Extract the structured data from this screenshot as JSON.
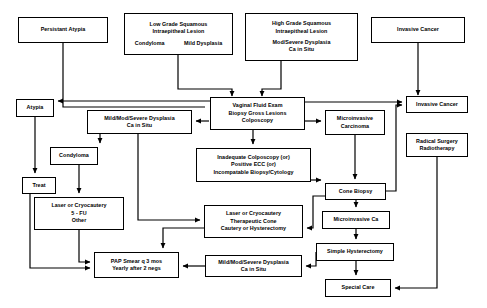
{
  "diagram": {
    "stroke_color": "#000000",
    "background_color": "#ffffff",
    "nodes": [
      {
        "id": "persistant-atypia",
        "lines": [
          "Persistant Atypia"
        ],
        "x": 18,
        "y": 17,
        "w": 90,
        "h": 26
      },
      {
        "id": "low-grade-sil",
        "lines": [
          "Low Grade Squamous",
          "Intraepitheal Lesion"
        ],
        "sub_lines": [
          "Condyloma",
          "Mild Dysplasia"
        ],
        "x": 124,
        "y": 13,
        "w": 109,
        "h": 42
      },
      {
        "id": "high-grade-sil",
        "lines": [
          "High Grade Squamous",
          "Intraepitheal Lesion"
        ],
        "sub_stack": [
          "Mod/Severe Dysplasia",
          "Ca in Situ"
        ],
        "x": 245,
        "y": 13,
        "w": 113,
        "h": 48
      },
      {
        "id": "invasive-cancer-top",
        "lines": [
          "Invasive Cancer"
        ],
        "x": 371,
        "y": 17,
        "w": 94,
        "h": 26
      },
      {
        "id": "vaginal-fluid-exam",
        "lines": [
          "Vaginal Fluid Exam",
          "Biopsy Gross Lesions",
          "Colposcopy"
        ],
        "x": 210,
        "y": 97,
        "w": 95,
        "h": 33
      },
      {
        "id": "atypia",
        "lines": [
          "Atypia"
        ],
        "x": 16,
        "y": 99,
        "w": 38,
        "h": 18
      },
      {
        "id": "mild-mod-severe-dysplasia-top",
        "lines": [
          "Mild/Mod/Severe Dysplasia",
          "Ca in Situ"
        ],
        "x": 87,
        "y": 110,
        "w": 105,
        "h": 24
      },
      {
        "id": "microinvasive-carcinoma",
        "lines": [
          "Microinvasive",
          "Carcinoma"
        ],
        "x": 325,
        "y": 110,
        "w": 60,
        "h": 25
      },
      {
        "id": "invasive-cancer-right",
        "lines": [
          "Invasive Cancer"
        ],
        "x": 406,
        "y": 96,
        "w": 62,
        "h": 17
      },
      {
        "id": "radical-surgery",
        "lines": [
          "Radical Surgery",
          "Radiotherapy"
        ],
        "x": 406,
        "y": 133,
        "w": 62,
        "h": 24
      },
      {
        "id": "condyloma",
        "lines": [
          "Condyloma"
        ],
        "x": 50,
        "y": 147,
        "w": 48,
        "h": 18
      },
      {
        "id": "inadequate-colposcopy",
        "lines": [
          "Inadequate Colposcopy (or)",
          "Positive ECC (or)",
          "Incompatable Biopsy/Cytology"
        ],
        "x": 196,
        "y": 148,
        "w": 115,
        "h": 34
      },
      {
        "id": "treat",
        "lines": [
          "Treat"
        ],
        "x": 22,
        "y": 177,
        "w": 34,
        "h": 17
      },
      {
        "id": "cone-biopsy",
        "lines": [
          "Cone Biopsy"
        ],
        "x": 325,
        "y": 183,
        "w": 61,
        "h": 17
      },
      {
        "id": "laser-cryocautery-5fu",
        "lines": [
          "Laser or Cryocautery",
          "5 - FU",
          "Other"
        ],
        "x": 34,
        "y": 197,
        "w": 90,
        "h": 33
      },
      {
        "id": "laser-cryocautery-therapeutic",
        "lines": [
          "Laser or Cryocautery",
          "Therapeutic Cone",
          "Cautery or Hysterectomy"
        ],
        "x": 204,
        "y": 205,
        "w": 99,
        "h": 33
      },
      {
        "id": "microinvasive-ca",
        "lines": [
          "Microinvasive Ca"
        ],
        "x": 322,
        "y": 211,
        "w": 68,
        "h": 18
      },
      {
        "id": "simple-hysterectomy",
        "lines": [
          "Simple Hysterectomy"
        ],
        "x": 316,
        "y": 243,
        "w": 78,
        "h": 18
      },
      {
        "id": "pap-smear",
        "lines": [
          "PAP Smear q 3 mos",
          "Yearly after 2 negs"
        ],
        "x": 94,
        "y": 252,
        "w": 85,
        "h": 26
      },
      {
        "id": "mild-mod-severe-dysplasia-bottom",
        "lines": [
          "Mild/Mod/Severe Dysplasia",
          "Ca in Situ"
        ],
        "x": 205,
        "y": 255,
        "w": 97,
        "h": 22
      },
      {
        "id": "special-care",
        "lines": [
          "Special Care"
        ],
        "x": 325,
        "y": 279,
        "w": 66,
        "h": 18
      }
    ],
    "edges": [
      {
        "from": "persistant-atypia",
        "to": "vaginal-fluid-exam",
        "label": ""
      },
      {
        "from": "low-grade-sil",
        "to": "vaginal-fluid-exam",
        "label": ""
      },
      {
        "from": "high-grade-sil",
        "to": "vaginal-fluid-exam",
        "label": ""
      },
      {
        "from": "invasive-cancer-top",
        "to": "invasive-cancer-right",
        "label": ""
      },
      {
        "from": "vaginal-fluid-exam",
        "to": "atypia",
        "label": ""
      },
      {
        "from": "vaginal-fluid-exam",
        "to": "mild-mod-severe-dysplasia-top",
        "label": ""
      },
      {
        "from": "vaginal-fluid-exam",
        "to": "microinvasive-carcinoma",
        "label": ""
      },
      {
        "from": "vaginal-fluid-exam",
        "to": "invasive-cancer-right",
        "label": ""
      },
      {
        "from": "vaginal-fluid-exam",
        "to": "inadequate-colposcopy",
        "label": ""
      },
      {
        "from": "atypia",
        "to": "treat",
        "label": ""
      },
      {
        "from": "treat",
        "to": "pap-smear",
        "label": ""
      },
      {
        "from": "mild-mod-severe-dysplasia-top",
        "to": "condyloma",
        "label": ""
      },
      {
        "from": "mild-mod-severe-dysplasia-top",
        "to": "laser-cryocautery-therapeutic",
        "label": ""
      },
      {
        "from": "condyloma",
        "to": "laser-cryocautery-5fu",
        "label": ""
      },
      {
        "from": "laser-cryocautery-5fu",
        "to": "pap-smear",
        "label": ""
      },
      {
        "from": "inadequate-colposcopy",
        "to": "cone-biopsy",
        "label": ""
      },
      {
        "from": "microinvasive-carcinoma",
        "to": "cone-biopsy",
        "label": ""
      },
      {
        "from": "cone-biopsy",
        "to": "microinvasive-ca",
        "label": ""
      },
      {
        "from": "cone-biopsy",
        "to": "invasive-cancer-right",
        "label": ""
      },
      {
        "from": "cone-biopsy",
        "to": "laser-cryocautery-therapeutic",
        "label": ""
      },
      {
        "from": "cone-biopsy",
        "to": "mild-mod-severe-dysplasia-bottom",
        "label": ""
      },
      {
        "from": "laser-cryocautery-therapeutic",
        "to": "pap-smear",
        "label": ""
      },
      {
        "from": "microinvasive-ca",
        "to": "simple-hysterectomy",
        "label": ""
      },
      {
        "from": "simple-hysterectomy",
        "to": "special-care",
        "label": ""
      },
      {
        "from": "radical-surgery",
        "to": "special-care",
        "label": ""
      },
      {
        "from": "mild-mod-severe-dysplasia-bottom",
        "to": "pap-smear",
        "label": ""
      }
    ]
  }
}
